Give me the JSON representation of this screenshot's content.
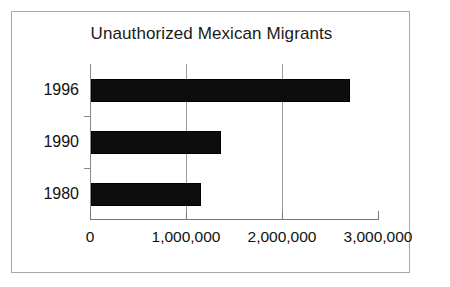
{
  "chart_data": {
    "type": "bar",
    "orientation": "horizontal",
    "title": "Unauthorized Mexican Migrants",
    "xlabel": "",
    "ylabel": "",
    "categories": [
      "1996",
      "1990",
      "1980"
    ],
    "values": [
      2700000,
      1350000,
      1150000
    ],
    "series": [
      {
        "name": "Unauthorized Mexican Migrants",
        "values": [
          2700000,
          1350000,
          1150000
        ],
        "color": "#000000"
      }
    ],
    "xlim": [
      0,
      3000000
    ],
    "xticks": [
      0,
      1000000,
      2000000,
      3000000
    ],
    "xtick_labels": [
      "0",
      "1,000,000",
      "2,000,000",
      "3,000,000"
    ],
    "grid": "vertical",
    "gridline_values": [
      1000000,
      2000000
    ],
    "legend": "none",
    "bar_color": "#000000",
    "background_color": "#ffffff",
    "frame_color": "#a8a8a8",
    "axis_color": "#777777"
  },
  "bars": [
    {
      "category": "1996",
      "value": 2700000,
      "label": "1996"
    },
    {
      "category": "1990",
      "value": 1350000,
      "label": "1990"
    },
    {
      "category": "1980",
      "value": 1150000,
      "label": "1980"
    }
  ],
  "axis": {
    "ticks": [
      {
        "value": 0,
        "label": "0"
      },
      {
        "value": 1000000,
        "label": "1,000,000"
      },
      {
        "value": 2000000,
        "label": "2,000,000"
      },
      {
        "value": 3000000,
        "label": "3,000,000"
      }
    ]
  }
}
